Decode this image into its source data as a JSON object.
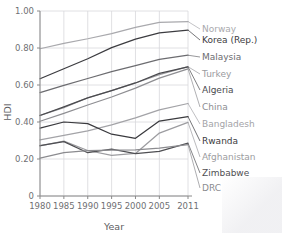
{
  "chart_data": {
    "type": "line",
    "title": "",
    "xlabel": "Year",
    "ylabel": "HDI",
    "x": [
      1980,
      1985,
      1990,
      1995,
      2000,
      2005,
      2011
    ],
    "xticklabels": [
      "1980",
      "1985",
      "1990",
      "1995",
      "2000",
      "2005",
      "2011"
    ],
    "yticklabels": [
      "0",
      "0.20",
      "0.40",
      "0.60",
      "0.80",
      "1.00"
    ],
    "ytickvalues": [
      0,
      0.2,
      0.4,
      0.6,
      0.8,
      1.0
    ],
    "xlim": [
      1980,
      2011
    ],
    "ylim": [
      0,
      1.0
    ],
    "grid": true,
    "legend_position": "right-inline-labels",
    "series": [
      {
        "name": "Norway",
        "color": "#a9a9ad",
        "values": [
          0.796,
          0.825,
          0.85,
          0.878,
          0.912,
          0.938,
          0.943
        ]
      },
      {
        "name": "Korea (Rep.)",
        "color": "#3c3c40",
        "values": [
          0.634,
          0.688,
          0.742,
          0.802,
          0.848,
          0.882,
          0.897
        ]
      },
      {
        "name": "Malaysia",
        "color": "#6c6c70",
        "values": [
          0.559,
          0.598,
          0.635,
          0.672,
          0.705,
          0.738,
          0.761
        ]
      },
      {
        "name": "Turkey",
        "color": "#9a9a9e",
        "values": [
          0.436,
          0.478,
          0.531,
          0.57,
          0.611,
          0.656,
          0.699
        ]
      },
      {
        "name": "Algeria",
        "color": "#4a4a4e",
        "values": [
          0.435,
          0.482,
          0.53,
          0.57,
          0.611,
          0.663,
          0.698
        ]
      },
      {
        "name": "China",
        "color": "#8e8e92",
        "values": [
          0.404,
          0.447,
          0.492,
          0.535,
          0.583,
          0.637,
          0.687
        ]
      },
      {
        "name": "Bangladesh",
        "color": "#a3a3a7",
        "values": [
          0.303,
          0.328,
          0.352,
          0.384,
          0.422,
          0.466,
          0.5
        ]
      },
      {
        "name": "Rwanda",
        "color": "#3a3a3e",
        "values": [
          0.367,
          0.4,
          0.391,
          0.334,
          0.312,
          0.405,
          0.429
        ]
      },
      {
        "name": "Afghanistan",
        "color": "#9c9ca0",
        "values": [
          0.271,
          0.297,
          0.246,
          0.22,
          0.23,
          0.34,
          0.398
        ]
      },
      {
        "name": "Zimbabwe",
        "color": "#4f4f53",
        "values": [
          0.272,
          0.294,
          0.234,
          0.253,
          0.229,
          0.241,
          0.286
        ]
      },
      {
        "name": "DRC",
        "color": "#8b8b8f",
        "values": [
          0.205,
          0.234,
          0.245,
          0.248,
          0.249,
          0.259,
          0.278
        ]
      }
    ]
  },
  "labels": {
    "ylabel": "HDI",
    "xlabel": "Year"
  }
}
